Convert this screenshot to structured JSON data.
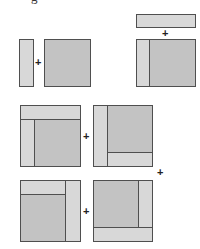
{
  "figure": {
    "header_fragment": "g",
    "operator_symbol": "+",
    "colors": {
      "square_fill": "#c3c3c3",
      "strip_fill": "#d8d8d8",
      "border": "#4f4f4f",
      "background": "#ffffff"
    },
    "rows": [
      {
        "left": {
          "description": "thin vertical strip",
          "parts": [
            "strip"
          ]
        },
        "right": {
          "description": "square",
          "parts": [
            "square"
          ]
        },
        "operator": "+"
      },
      {
        "left_top": {
          "description": "horizontal strip above combined shape",
          "parts": [
            "strip"
          ]
        },
        "left_bottom": {
          "description": "square with strip on left",
          "parts": [
            "strip-left",
            "square"
          ]
        },
        "operator": "+"
      },
      {
        "left": {
          "description": "square with strips on top and left",
          "parts": [
            "strip-top",
            "strip-left",
            "square"
          ]
        },
        "right": {
          "description": "square with strips on left and bottom",
          "parts": [
            "strip-left",
            "strip-bottom",
            "square"
          ]
        },
        "operator": "+"
      },
      {
        "left": {
          "description": "square with strips on top-left and right",
          "parts": [
            "strip-top",
            "strip-right",
            "square"
          ]
        },
        "right": {
          "description": "square with strips on right and bottom",
          "parts": [
            "strip-right",
            "strip-bottom",
            "square"
          ]
        },
        "operator": "+"
      }
    ],
    "extra_operator": "+"
  }
}
